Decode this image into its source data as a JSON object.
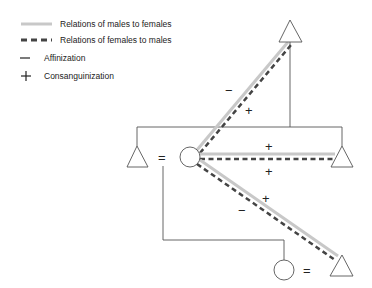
{
  "legend": {
    "items": [
      {
        "symbol": "solid-gray-line",
        "label": "Relations of males to females",
        "color": "#c8c8c8"
      },
      {
        "symbol": "dashed-dark-line",
        "label": "Relations of females to males",
        "color": "#444444"
      },
      {
        "symbol": "minus",
        "glyph": "−",
        "label": "Affinization"
      },
      {
        "symbol": "plus",
        "glyph": "+",
        "label": "Consanguinization"
      }
    ]
  },
  "diagram": {
    "nodes": [
      {
        "id": "ego",
        "shape": "circle",
        "sex": "female"
      },
      {
        "id": "husband",
        "shape": "triangle",
        "sex": "male"
      },
      {
        "id": "father",
        "shape": "triangle",
        "sex": "male"
      },
      {
        "id": "brother",
        "shape": "triangle",
        "sex": "male"
      },
      {
        "id": "daughter",
        "shape": "circle",
        "sex": "female"
      },
      {
        "id": "son-in-law",
        "shape": "triangle",
        "sex": "male"
      }
    ],
    "marriage_symbol": "=",
    "edge_labels": {
      "to_father": [
        "−",
        "+"
      ],
      "to_brother": [
        "+",
        "+"
      ],
      "to_son_in_law": [
        "+",
        "−"
      ]
    }
  }
}
